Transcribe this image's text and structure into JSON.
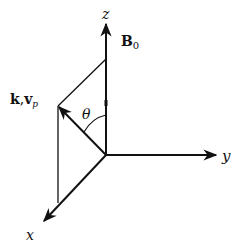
{
  "diagram": {
    "type": "3d-coordinate-axes",
    "axes": {
      "z": {
        "label": "z"
      },
      "y": {
        "label": "y"
      },
      "x": {
        "label": "x"
      }
    },
    "field": {
      "label_main": "B",
      "label_sub": "0"
    },
    "wave_vector": {
      "label_k": "k",
      "label_sep": ",",
      "label_v": "v",
      "label_v_sub": "p"
    },
    "angle": {
      "label": "θ"
    },
    "colors": {
      "line": "#111111",
      "background": "#ffffff"
    }
  }
}
